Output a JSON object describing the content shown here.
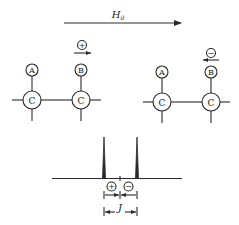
{
  "field_arrow": {
    "label": "H",
    "label_subscript": "0"
  },
  "left_group": {
    "spin_sign": "+",
    "spin_direction": "right",
    "atoms": {
      "top_left": "A",
      "top_right": "B",
      "bottom_left": "C",
      "bottom_right": "C"
    }
  },
  "right_group": {
    "spin_sign": "−",
    "spin_direction": "left",
    "atoms": {
      "top_left": "A",
      "top_right": "B",
      "bottom_left": "C",
      "bottom_right": "C"
    }
  },
  "spectrum": {
    "peak_signs": [
      "+",
      "−"
    ],
    "coupling_label": "J"
  }
}
